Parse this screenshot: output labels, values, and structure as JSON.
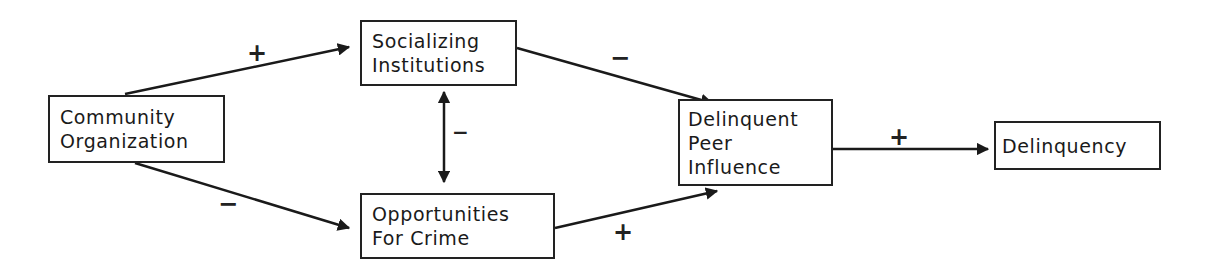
{
  "diagram": {
    "nodes": [
      {
        "id": "community-organization",
        "lines": [
          "Community",
          "Organization"
        ]
      },
      {
        "id": "socializing-institutions",
        "lines": [
          "Socializing",
          "Institutions"
        ]
      },
      {
        "id": "opportunities-for-crime",
        "lines": [
          "Opportunities",
          "For Crime"
        ]
      },
      {
        "id": "delinquent-peer-influence",
        "lines": [
          "Delinquent",
          "Peer",
          "Influence"
        ]
      },
      {
        "id": "delinquency",
        "lines": [
          "Delinquency"
        ]
      }
    ],
    "edges": [
      {
        "from": "community-organization",
        "to": "socializing-institutions",
        "sign": "+"
      },
      {
        "from": "community-organization",
        "to": "opportunities-for-crime",
        "sign": "−"
      },
      {
        "from": "socializing-institutions",
        "to": "opportunities-for-crime",
        "sign": "−",
        "bidirectional": true
      },
      {
        "from": "socializing-institutions",
        "to": "delinquent-peer-influence",
        "sign": "−"
      },
      {
        "from": "opportunities-for-crime",
        "to": "delinquent-peer-influence",
        "sign": "+"
      },
      {
        "from": "delinquent-peer-influence",
        "to": "delinquency",
        "sign": "+"
      }
    ]
  }
}
